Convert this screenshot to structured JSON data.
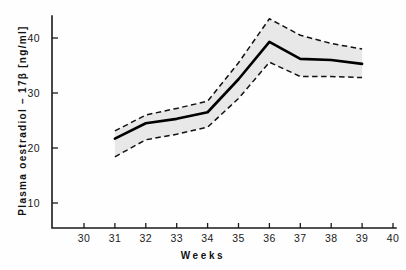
{
  "chart_data": {
    "type": "line",
    "title": "",
    "xlabel": "Weeks",
    "ylabel": "Plasma  oestradiol – 17β  [ng/ml]",
    "xlim": [
      30,
      40
    ],
    "ylim": [
      7,
      45
    ],
    "xticks": [
      30,
      31,
      32,
      33,
      34,
      35,
      36,
      37,
      38,
      39,
      40
    ],
    "yticks": [
      10,
      20,
      30,
      40
    ],
    "xtick_labels": [
      "30",
      "31",
      "32",
      "33",
      "34",
      "35",
      "36",
      "37",
      "38",
      "39",
      "40"
    ],
    "ytick_labels": [
      "10",
      "20",
      "30",
      "40"
    ],
    "grid": false,
    "legend": false,
    "x": [
      31,
      32,
      33,
      34,
      35,
      36,
      37,
      38,
      39
    ],
    "series": [
      {
        "name": "mean",
        "style": "solid",
        "color": "#000000",
        "values": [
          21.7,
          24.5,
          25.3,
          26.5,
          32.5,
          39.3,
          36.2,
          36.0,
          35.3
        ]
      },
      {
        "name": "upper band",
        "style": "dashed",
        "color": "#111111",
        "values": [
          23.1,
          26.0,
          27.2,
          28.5,
          35.5,
          43.5,
          40.5,
          39.0,
          38.0
        ]
      },
      {
        "name": "lower band",
        "style": "dashed",
        "color": "#111111",
        "values": [
          18.4,
          21.5,
          22.5,
          23.8,
          29.0,
          35.6,
          33.0,
          33.0,
          32.8
        ]
      }
    ],
    "band_fill_color": "#e4e4e4"
  }
}
